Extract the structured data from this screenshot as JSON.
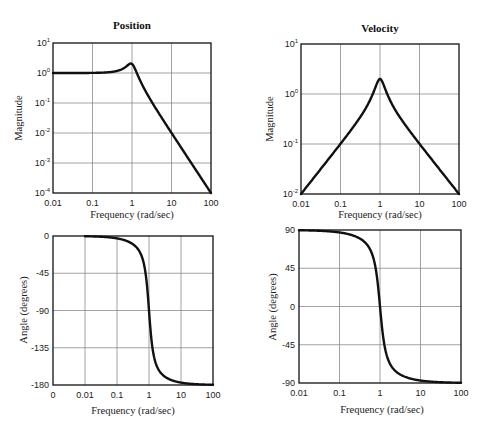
{
  "figure": {
    "colors": {
      "curve": "#111111",
      "grid": "#8a8a8a",
      "frame": "#111111",
      "background": "#ffffff"
    }
  },
  "panels": {
    "pos_mag": {
      "title": "Position",
      "xlabel": "Frequency (rad/sec)",
      "ylabel": "Magnitude",
      "xticks": [
        "0.01",
        "0.1",
        "1",
        "10",
        "100"
      ],
      "yticks": [
        {
          "base": "10",
          "exp": "1"
        },
        {
          "base": "10",
          "exp": "0"
        },
        {
          "base": "10",
          "exp": "-1"
        },
        {
          "base": "10",
          "exp": "-2"
        },
        {
          "base": "10",
          "exp": "-3"
        },
        {
          "base": "10",
          "exp": "-4"
        }
      ]
    },
    "vel_mag": {
      "title": "Velocity",
      "xlabel": "Frequency (rad/sec)",
      "ylabel": "Magnitude",
      "xticks": [
        "0.01",
        "0.1",
        "1",
        "10",
        "100"
      ],
      "yticks": [
        {
          "base": "10",
          "exp": "1"
        },
        {
          "base": "10",
          "exp": "0"
        },
        {
          "base": "10",
          "exp": "-1"
        },
        {
          "base": "10",
          "exp": "-2"
        }
      ]
    },
    "pos_phase": {
      "title": "",
      "xlabel": "Frequency (rad/sec)",
      "ylabel": "Angle (degrees)",
      "xticks": [
        "0",
        "0.01",
        "0.1",
        "1",
        "10",
        "100"
      ],
      "yticks": [
        "0",
        "-45",
        "-90",
        "-135",
        "-180"
      ]
    },
    "vel_phase": {
      "title": "",
      "xlabel": "Frequency (rad/sec)",
      "ylabel": "Angle (degrees)",
      "xticks": [
        "0.01",
        "0.1",
        "1",
        "10",
        "100"
      ],
      "yticks": [
        "90",
        "45",
        "0",
        "-45",
        "-90"
      ]
    }
  },
  "chart_data": [
    {
      "type": "line",
      "title": "Position",
      "xlabel": "Frequency (rad/sec)",
      "ylabel": "Magnitude",
      "xscale": "log",
      "yscale": "log",
      "xlim": [
        0.01,
        100
      ],
      "ylim": [
        0.0001,
        10
      ],
      "grid": true,
      "model": {
        "natural_frequency": 1,
        "damping_ratio": 0.25,
        "form": "1/(s^2+2*zeta*s+1)"
      },
      "x": [
        0.01,
        0.1,
        0.3,
        0.5,
        0.7,
        0.9,
        1,
        1.2,
        1.5,
        2,
        3,
        5,
        10,
        30,
        100
      ],
      "values": [
        1.0,
        1.01,
        1.09,
        1.26,
        1.6,
        2.1,
        2.0,
        1.5,
        0.75,
        0.32,
        0.12,
        0.041,
        0.0101,
        0.0011,
        0.0001
      ],
      "annotations": [
        "Resonant peak ~2 at 1 rad/sec"
      ]
    },
    {
      "type": "line",
      "title": "Velocity",
      "xlabel": "Frequency (rad/sec)",
      "ylabel": "Magnitude",
      "xscale": "log",
      "yscale": "log",
      "xlim": [
        0.01,
        100
      ],
      "ylim": [
        0.01,
        10
      ],
      "grid": true,
      "model": {
        "natural_frequency": 1,
        "damping_ratio": 0.25,
        "form": "s/(s^2+2*zeta*s+1)"
      },
      "x": [
        0.01,
        0.1,
        0.3,
        0.5,
        0.7,
        0.9,
        1,
        1.2,
        1.5,
        2,
        3,
        10,
        100
      ],
      "values": [
        0.01,
        0.101,
        0.33,
        0.63,
        1.12,
        1.89,
        2.0,
        1.8,
        1.12,
        0.64,
        0.36,
        0.101,
        0.01
      ]
    },
    {
      "type": "line",
      "title": "",
      "xlabel": "Frequency (rad/sec)",
      "ylabel": "Angle (degrees)",
      "xscale": "log",
      "xtick_labels": [
        "0",
        "0.01",
        "0.1",
        "1",
        "10",
        "100"
      ],
      "xlim": [
        0.001,
        100
      ],
      "ylim": [
        -180,
        0
      ],
      "grid": true,
      "x": [
        0.01,
        0.1,
        0.3,
        0.5,
        0.7,
        0.9,
        1,
        1.2,
        1.5,
        2,
        3,
        10,
        100
      ],
      "values": [
        -0.3,
        -2.9,
        -9.4,
        -18.4,
        -34.5,
        -67.1,
        -90,
        -126.9,
        -146.3,
        -161.6,
        -169.4,
        -177.1,
        -179.7
      ]
    },
    {
      "type": "line",
      "title": "",
      "xlabel": "Frequency (rad/sec)",
      "ylabel": "Angle (degrees)",
      "xscale": "log",
      "xlim": [
        0.01,
        100
      ],
      "ylim": [
        -90,
        90
      ],
      "grid": true,
      "x": [
        0.01,
        0.1,
        0.3,
        0.5,
        0.7,
        0.9,
        1,
        1.2,
        1.5,
        2,
        3,
        10,
        100
      ],
      "values": [
        89.7,
        87.1,
        80.6,
        71.6,
        55.5,
        22.9,
        0,
        -36.9,
        -56.3,
        -71.6,
        -79.4,
        -87.1,
        -89.7
      ]
    }
  ]
}
